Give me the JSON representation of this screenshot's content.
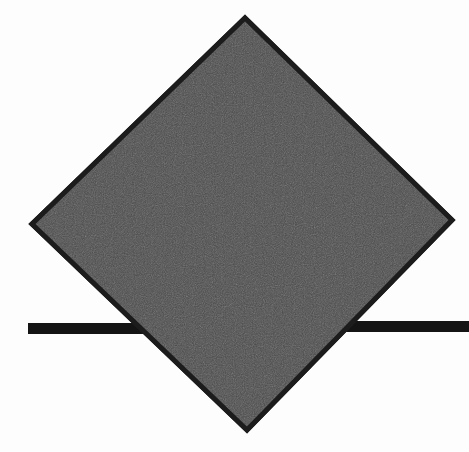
{
  "figure": {
    "title": "Rotated square with horizontal line",
    "width": 469,
    "height": 452,
    "background_color": "#fdfdfd"
  },
  "shapes": {
    "diamond": {
      "name": "rotated-square",
      "fill_color": "#4a4a4a",
      "stroke_color": "#1c1c1c",
      "stroke_width": 5,
      "points": "245,18 452,220 247,430 32,224",
      "vertices": {
        "top": [
          245,
          18
        ],
        "right": [
          452,
          220
        ],
        "bottom": [
          247,
          430
        ],
        "left": [
          32,
          224
        ]
      }
    },
    "bar_left": {
      "name": "horizontal-bar-left-segment",
      "fill_color": "#141414",
      "x": 28,
      "y": 323,
      "width": 130,
      "height": 11
    },
    "bar_right": {
      "name": "horizontal-bar-right-segment",
      "fill_color": "#141414",
      "x": 345,
      "y": 321,
      "width": 124,
      "height": 11
    }
  },
  "texture": {
    "noise_opacity": 0.22,
    "noise_base_frequency": 0.9
  }
}
